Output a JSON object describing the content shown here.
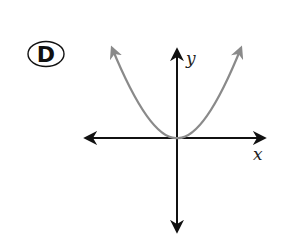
{
  "option": {
    "letter": "D"
  },
  "graph": {
    "x_label": "x",
    "y_label": "y",
    "curve": "parabola opening upward with vertex at origin",
    "curve_color": "#8a8a8a",
    "axis_color": "#111111"
  }
}
